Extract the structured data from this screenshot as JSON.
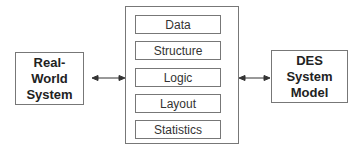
{
  "diagram": {
    "left_node": {
      "label": "Real-World\nSystem"
    },
    "center_node": {
      "items": [
        {
          "label": "Data"
        },
        {
          "label": "Structure"
        },
        {
          "label": "Logic"
        },
        {
          "label": "Layout"
        },
        {
          "label": "Statistics"
        }
      ]
    },
    "right_node": {
      "label": "DES\nSystem\nModel"
    },
    "edges": [
      {
        "from": "left_node",
        "to": "center_node",
        "type": "bidirectional-arrow"
      },
      {
        "from": "center_node",
        "to": "right_node",
        "type": "bidirectional-arrow"
      }
    ],
    "colors": {
      "stroke": "#777777",
      "text": "#222222",
      "background": "#ffffff"
    }
  }
}
